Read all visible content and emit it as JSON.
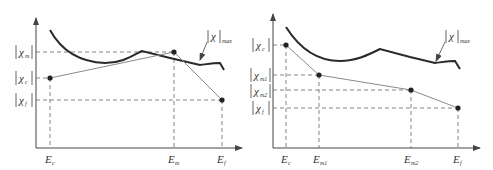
{
  "diagrams": [
    {
      "id": "left",
      "curve_label": "|χ|max",
      "curve_label_parts": {
        "chi": "χ",
        "sub": "max"
      },
      "y_labels": [
        {
          "chi": "χ",
          "sub": "m",
          "y": 52
        },
        {
          "chi": "χ",
          "sub": "c",
          "y": 78
        },
        {
          "chi": "χ",
          "sub": "f",
          "y": 100
        }
      ],
      "x_labels": [
        {
          "E": "E",
          "sub": "c",
          "x": 50
        },
        {
          "E": "E",
          "sub": "m",
          "x": 174
        },
        {
          "E": "E",
          "sub": "f",
          "x": 222
        }
      ],
      "points": [
        [
          50,
          78
        ],
        [
          174,
          52
        ],
        [
          222,
          100
        ]
      ]
    },
    {
      "id": "right",
      "curve_label": "|χ|max",
      "curve_label_parts": {
        "chi": "χ",
        "sub": "max"
      },
      "y_labels": [
        {
          "chi": "χ",
          "sub": "c",
          "y": 45
        },
        {
          "chi": "χ",
          "sub": "m1",
          "y": 75
        },
        {
          "chi": "χ",
          "sub": "m2",
          "y": 90
        },
        {
          "chi": "χ",
          "sub": "f",
          "y": 108
        }
      ],
      "x_labels": [
        {
          "E": "E",
          "sub": "c",
          "x": 286
        },
        {
          "E": "E",
          "sub": "m1",
          "x": 319
        },
        {
          "E": "E",
          "sub": "m2",
          "x": 411
        },
        {
          "E": "E",
          "sub": "f",
          "x": 458
        }
      ],
      "points": [
        [
          286,
          45
        ],
        [
          319,
          75
        ],
        [
          411,
          90
        ],
        [
          458,
          108
        ]
      ]
    }
  ],
  "labels": {
    "left": {
      "chi_m_sub": "m",
      "chi_c_sub": "c",
      "chi_f_sub": "f",
      "E_c_sub": "c",
      "E_m_sub": "m",
      "E_f_sub": "f",
      "max_sub": "max",
      "chi": "χ",
      "E": "E"
    },
    "right": {
      "chi_c_sub": "c",
      "chi_m1_sub": "m1",
      "chi_m2_sub": "m2",
      "chi_f_sub": "f",
      "E_c_sub": "c",
      "E_m1_sub": "m1",
      "E_m2_sub": "m2",
      "E_f_sub": "f",
      "max_sub": "max",
      "chi": "χ",
      "E": "E"
    }
  },
  "colors": {
    "axis": "#444444",
    "curve": "#2a2a2a",
    "path": "#8a8a8a",
    "dash": "#666666",
    "point": "#222222"
  }
}
